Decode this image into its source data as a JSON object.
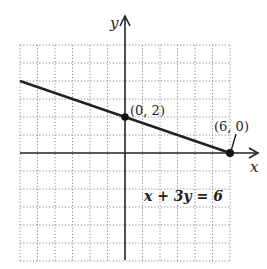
{
  "graph": {
    "x_axis_label": "x",
    "y_axis_label": "y",
    "equation": "x + 3y = 6",
    "points": [
      {
        "label": "(0, 2)",
        "x": 0,
        "y": 2
      },
      {
        "label": "(6, 0)",
        "x": 6,
        "y": 0
      }
    ],
    "grid": {
      "xmin": -6,
      "xmax": 6,
      "ymin": -6,
      "ymax": 6,
      "step": 1
    },
    "colors": {
      "line": "#222222",
      "grid": "#888888",
      "axis": "#222222"
    }
  },
  "chart_data": {
    "type": "line",
    "title": "",
    "xlabel": "x",
    "ylabel": "y",
    "xlim": [
      -6,
      6
    ],
    "ylim": [
      -6,
      6
    ],
    "grid": true,
    "series": [
      {
        "name": "x + 3y = 6",
        "x": [
          -6,
          0,
          6
        ],
        "y": [
          4,
          2,
          0
        ]
      }
    ],
    "annotations": [
      {
        "text": "(0, 2)",
        "x": 0,
        "y": 2
      },
      {
        "text": "(6, 0)",
        "x": 6,
        "y": 0
      },
      {
        "text": "x + 3y = 6",
        "x": 3.5,
        "y": -3
      }
    ]
  }
}
